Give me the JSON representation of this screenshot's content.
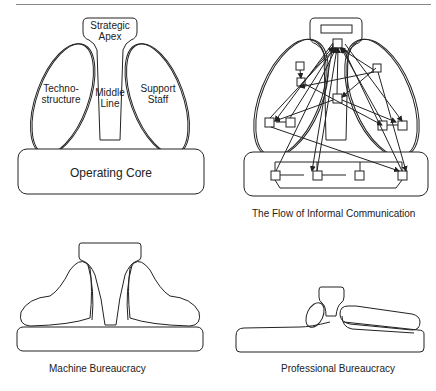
{
  "diagram": {
    "panels": [
      {
        "id": "basic-parts",
        "parts": {
          "strategic_apex": [
            "Strategic",
            "Apex"
          ],
          "technostructure": [
            "Techno-",
            "structure"
          ],
          "middle_line": [
            "Middle",
            "Line"
          ],
          "support_staff": [
            "Support",
            "Staff"
          ],
          "operating_core": "Operating Core"
        }
      },
      {
        "id": "informal-communication",
        "caption": "The Flow of Informal Communication"
      },
      {
        "id": "machine-bureaucracy",
        "caption": "Machine Bureaucracy"
      },
      {
        "id": "professional-bureaucracy",
        "caption": "Professional Bureaucracy"
      }
    ]
  }
}
